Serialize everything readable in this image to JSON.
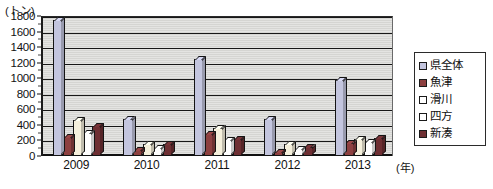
{
  "chart_data": {
    "type": "bar",
    "title": "",
    "subtitle": "",
    "xlabel": "(年)",
    "ylabel": "(トン)",
    "unit_label_y": "(トン)",
    "unit_label_x": "(年)",
    "categories": [
      "2009",
      "2010",
      "2011",
      "2012",
      "2013"
    ],
    "ylim": [
      0,
      1800
    ],
    "ytick_step": 200,
    "yticks": [
      0,
      200,
      400,
      600,
      800,
      1000,
      1200,
      1400,
      1600,
      1800
    ],
    "ytick_labels": [
      "0",
      "200",
      "400",
      "600",
      "800",
      "1000",
      "1200",
      "1400",
      "1600",
      "1800"
    ],
    "grid": true,
    "grid_axis": "y",
    "legend_position": "right",
    "plot_background": "#d9d9d6",
    "series": [
      {
        "name": "県全体",
        "color": "#c3c5de",
        "values": [
          1750,
          470,
          1250,
          480,
          980
        ]
      },
      {
        "name": "魚津",
        "color": "#8d4040",
        "values": [
          240,
          80,
          280,
          50,
          170
        ]
      },
      {
        "name": "滑川",
        "color": "#f5f0dc",
        "values": [
          460,
          150,
          360,
          160,
          220
        ]
      },
      {
        "name": "四方",
        "color": "#ffffff",
        "values": [
          300,
          100,
          200,
          90,
          180
        ]
      },
      {
        "name": "新湊",
        "color": "#6e2f33",
        "values": [
          390,
          150,
          220,
          110,
          230
        ]
      }
    ]
  },
  "legend": {
    "items": [
      {
        "label": "県全体",
        "color": "#c3c5de"
      },
      {
        "label": "魚津",
        "color": "#8d4040"
      },
      {
        "label": "滑川",
        "color": "#ffffff"
      },
      {
        "label": "四方",
        "color": "#ffffff"
      },
      {
        "label": "新湊",
        "color": "#6e2f33"
      }
    ]
  }
}
